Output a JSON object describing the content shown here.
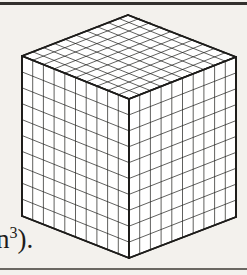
{
  "page": {
    "background_color": "#f3f1ed",
    "ink_color": "#1d1c1a",
    "rules": {
      "top_label": "top-horizontal-rule",
      "bottom_label": "bottom-horizontal-rule"
    }
  },
  "caption": {
    "text_before_superscript": "n",
    "superscript": "3",
    "text_after_superscript": ")."
  },
  "figure": {
    "divisions_per_edge": 10,
    "total_unit_cubes": 1000,
    "faces": [
      "top",
      "front-left",
      "front-right"
    ],
    "line_color": "#1d1c1a",
    "fill_color": "#ffffff",
    "outline_width": 1.8,
    "grid_width": 0.7,
    "geometry": {
      "apex_top": [
        128,
        15
      ],
      "corner_left": [
        22,
        56
      ],
      "corner_right": [
        236,
        57
      ],
      "corner_front_top": [
        129,
        99
      ],
      "corner_front_bottom": [
        129,
        258
      ],
      "corner_left_bottom": [
        22,
        216
      ],
      "corner_right_bottom": [
        236,
        217
      ]
    }
  }
}
